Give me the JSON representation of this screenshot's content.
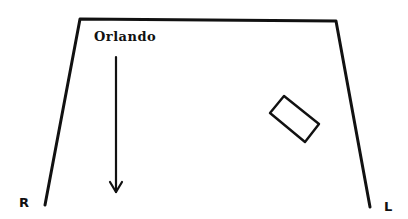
{
  "diagram": {
    "type": "stage-blocking",
    "character_label": "Orlando",
    "stage_right_label": "R",
    "stage_left_label": "L",
    "stroke_color": "#111111",
    "background_color": "#ffffff",
    "stage_outline": {
      "top_left": [
        80,
        19
      ],
      "top_right": [
        336,
        21
      ],
      "bottom_left": [
        45,
        205
      ],
      "bottom_right": [
        370,
        207
      ]
    },
    "movement_arrow": {
      "from": [
        116,
        57
      ],
      "to": [
        116,
        192
      ],
      "direction": "downstage"
    },
    "set_piece": {
      "shape": "rectangle",
      "corners": [
        [
          284,
          96
        ],
        [
          319,
          124
        ],
        [
          305,
          142
        ],
        [
          270,
          113
        ]
      ]
    }
  }
}
